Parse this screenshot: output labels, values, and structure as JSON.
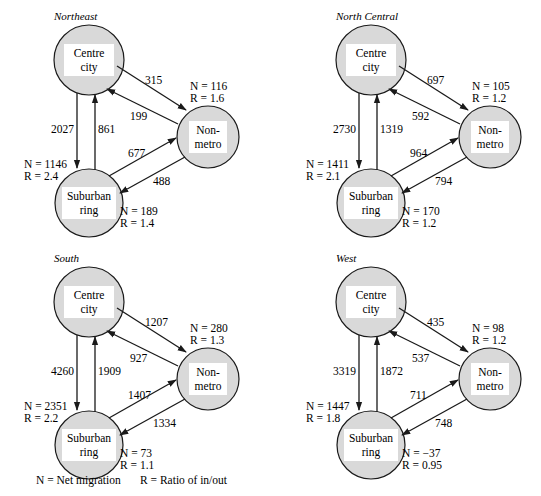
{
  "colors": {
    "node_fill": "#d9d9d9",
    "node_label_bg": "#ffffff",
    "stroke": "#1a1a1a"
  },
  "legend": {
    "n": "N = Net migration",
    "r": "R = Ratio of in/out"
  },
  "panels": [
    {
      "title": "Northeast",
      "nodes": {
        "centre": {
          "line1": "Centre",
          "line2": "city"
        },
        "nonmetro": {
          "line1": "Non-",
          "line2": "metro",
          "n": "N = 116",
          "r": "R = 1.6"
        },
        "suburban": {
          "line1": "Suburban",
          "line2": "ring",
          "n": "N = 189",
          "r": "R = 1.4"
        }
      },
      "centre_stats": {
        "n": "N = 1146",
        "r": "R = 2.4"
      },
      "flows": {
        "centre_to_nonmetro": "315",
        "nonmetro_to_centre": "199",
        "centre_to_suburban": "2027",
        "suburban_to_centre": "861",
        "suburban_to_nonmetro": "677",
        "nonmetro_to_suburban": "488"
      }
    },
    {
      "title": "North Central",
      "nodes": {
        "centre": {
          "line1": "Centre",
          "line2": "city"
        },
        "nonmetro": {
          "line1": "Non-",
          "line2": "metro",
          "n": "N = 105",
          "r": "R = 1.2"
        },
        "suburban": {
          "line1": "Suburban",
          "line2": "ring",
          "n": "N = 170",
          "r": "R = 1.2"
        }
      },
      "centre_stats": {
        "n": "N = 1411",
        "r": "R = 2.1"
      },
      "flows": {
        "centre_to_nonmetro": "697",
        "nonmetro_to_centre": "592",
        "centre_to_suburban": "2730",
        "suburban_to_centre": "1319",
        "suburban_to_nonmetro": "964",
        "nonmetro_to_suburban": "794"
      }
    },
    {
      "title": "South",
      "nodes": {
        "centre": {
          "line1": "Centre",
          "line2": "city"
        },
        "nonmetro": {
          "line1": "Non-",
          "line2": "metro",
          "n": "N = 280",
          "r": "R = 1.3"
        },
        "suburban": {
          "line1": "Suburban",
          "line2": "ring",
          "n": "N = 73",
          "r": "R = 1.1"
        }
      },
      "centre_stats": {
        "n": "N = 2351",
        "r": "R = 2.2"
      },
      "flows": {
        "centre_to_nonmetro": "1207",
        "nonmetro_to_centre": "927",
        "centre_to_suburban": "4260",
        "suburban_to_centre": "1909",
        "suburban_to_nonmetro": "1407",
        "nonmetro_to_suburban": "1334"
      }
    },
    {
      "title": "West",
      "nodes": {
        "centre": {
          "line1": "Centre",
          "line2": "city"
        },
        "nonmetro": {
          "line1": "Non-",
          "line2": "metro",
          "n": "N = 98",
          "r": "R = 1.2"
        },
        "suburban": {
          "line1": "Suburban",
          "line2": "ring",
          "n": "N = −37",
          "r": "R = 0.95"
        }
      },
      "centre_stats": {
        "n": "N = 1447",
        "r": "R = 1.8"
      },
      "flows": {
        "centre_to_nonmetro": "435",
        "nonmetro_to_centre": "537",
        "centre_to_suburban": "3319",
        "suburban_to_centre": "1872",
        "suburban_to_nonmetro": "711",
        "nonmetro_to_suburban": "748"
      }
    }
  ]
}
